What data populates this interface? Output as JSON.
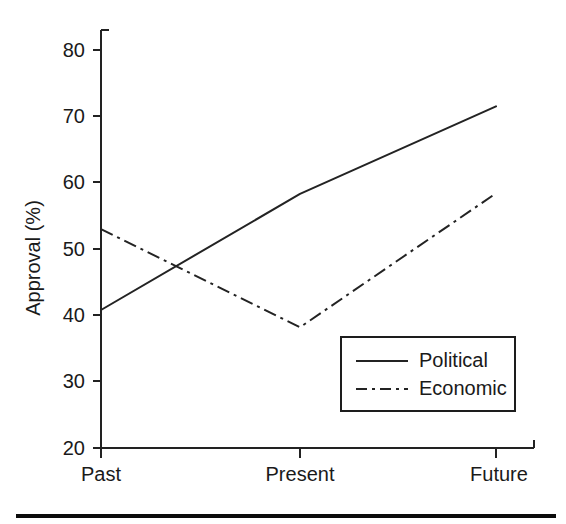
{
  "chart_data": {
    "type": "line",
    "title": "",
    "xlabel": "",
    "ylabel": "Approval (%)",
    "categories": [
      "Past",
      "Present",
      "Future"
    ],
    "ylim": [
      20,
      80
    ],
    "yticks": [
      20,
      30,
      40,
      50,
      60,
      70,
      80
    ],
    "ytick_labels": [
      "20",
      "30",
      "40",
      "50",
      "60",
      "70",
      "80"
    ],
    "grid": false,
    "legend_position": "lower right",
    "series": [
      {
        "name": "Political",
        "style": "solid",
        "values": [
          40.8,
          58.3,
          71.5
        ]
      },
      {
        "name": "Economic",
        "style": "dash-dot",
        "values": [
          53.0,
          38.2,
          58.4
        ]
      }
    ]
  },
  "axes": {
    "y_title": "Approval (%)",
    "y_tick_0": "20",
    "y_tick_1": "30",
    "y_tick_2": "40",
    "y_tick_3": "50",
    "y_tick_4": "60",
    "y_tick_5": "70",
    "y_tick_6": "80",
    "x_tick_0": "Past",
    "x_tick_1": "Present",
    "x_tick_2": "Future"
  },
  "legend": {
    "entries": [
      {
        "label": "Political",
        "style": "solid"
      },
      {
        "label": "Economic",
        "style": "dash-dot"
      }
    ]
  },
  "colors": {
    "line": "#232323",
    "axis": "#222222",
    "text": "#1a1a1a",
    "background": "#ffffff",
    "rule": "#0b0b0b"
  }
}
